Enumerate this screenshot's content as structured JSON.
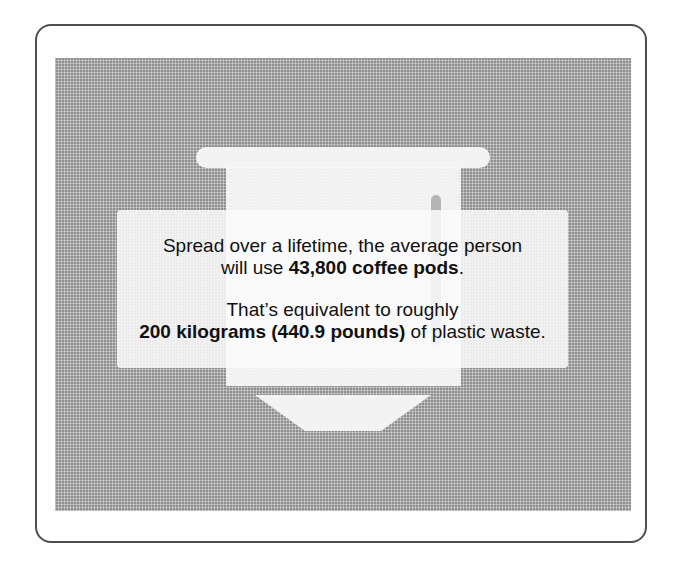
{
  "card": {
    "line1": "Spread over a lifetime, the average person",
    "line2_prefix": "will use ",
    "line2_bold": "43,800 coffee pods",
    "line2_suffix": ".",
    "line3": "That’s equivalent to roughly",
    "line4_bold": "200 kilograms (440.9 pounds)",
    "line4_suffix": " of plastic waste."
  },
  "illustration": {
    "icon": "coffee-pod-icon",
    "panel_color": "#8f8f8f",
    "shape_color": "#f3f3f3",
    "frame_color": "#4f4f4f"
  }
}
